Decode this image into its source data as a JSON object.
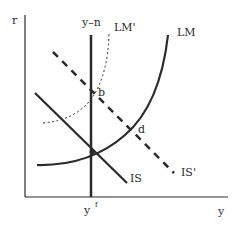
{
  "diagram": {
    "type": "IS-LM",
    "axes": {
      "y_axis_label": "r",
      "x_axis_label": "y"
    },
    "vertical_line": {
      "label": "y–n",
      "x_tick_label": "y",
      "x_tick_superscript": "f"
    },
    "curves": {
      "is": {
        "label": "IS",
        "style": "solid"
      },
      "is_prime": {
        "label": "IS'",
        "style": "dashed"
      },
      "lm": {
        "label": "LM",
        "style": "solid"
      },
      "lm_prime": {
        "label": "LM'",
        "style": "dotted"
      }
    },
    "points": {
      "b": {
        "label": "b"
      },
      "d": {
        "label": "d"
      }
    },
    "colors": {
      "line": "#2a2a2a",
      "background": "#ffffff"
    }
  }
}
